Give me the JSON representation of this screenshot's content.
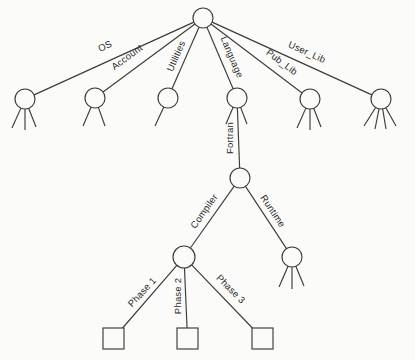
{
  "diagram": {
    "canvas": {
      "width": 415,
      "height": 360,
      "background": "#fbfbf9",
      "stroke_color": "#3c3c3c",
      "text_color": "#2a2a2a",
      "stroke_width": 1.15
    },
    "nodes": [
      {
        "id": "root",
        "shape": "circle",
        "x": 203,
        "y": 18,
        "r": 10
      },
      {
        "id": "os",
        "shape": "circle",
        "x": 25,
        "y": 99,
        "r": 10,
        "legs": [
          [
            -13,
            29
          ],
          [
            0,
            31
          ],
          [
            11,
            28
          ]
        ]
      },
      {
        "id": "account",
        "shape": "circle",
        "x": 95,
        "y": 98,
        "r": 10,
        "legs": [
          [
            -12,
            28
          ],
          [
            10,
            28
          ]
        ]
      },
      {
        "id": "utilities",
        "shape": "circle",
        "x": 168,
        "y": 98,
        "r": 10,
        "legs": [
          [
            -13,
            28
          ]
        ]
      },
      {
        "id": "language",
        "shape": "circle",
        "x": 237,
        "y": 98,
        "r": 10,
        "legs": [
          [
            -11,
            26
          ],
          [
            10,
            26
          ]
        ]
      },
      {
        "id": "pub-lib",
        "shape": "circle",
        "x": 310,
        "y": 99,
        "r": 10,
        "legs": [
          [
            -13,
            29
          ],
          [
            0,
            31
          ],
          [
            11,
            28
          ]
        ]
      },
      {
        "id": "user-lib",
        "shape": "circle",
        "x": 381,
        "y": 99,
        "r": 10,
        "legs": [
          [
            -17,
            27
          ],
          [
            -6,
            30
          ],
          [
            5,
            30
          ],
          [
            15,
            27
          ]
        ]
      },
      {
        "id": "fortran",
        "shape": "circle",
        "x": 240,
        "y": 178,
        "r": 10
      },
      {
        "id": "compiler",
        "shape": "circle",
        "x": 184,
        "y": 257,
        "r": 11
      },
      {
        "id": "runtime",
        "shape": "circle",
        "x": 292,
        "y": 257,
        "r": 10,
        "legs": [
          [
            -13,
            30
          ],
          [
            0,
            32
          ],
          [
            12,
            29
          ]
        ]
      },
      {
        "id": "phase-1",
        "shape": "square",
        "x": 113.5,
        "y": 338.5,
        "size": 21
      },
      {
        "id": "phase-2",
        "shape": "square",
        "x": 187.5,
        "y": 338.5,
        "size": 21
      },
      {
        "id": "phase-3",
        "shape": "square",
        "x": 262.5,
        "y": 338.5,
        "size": 21
      }
    ],
    "edges": [
      {
        "from": "root",
        "to": "os",
        "label": "OS",
        "label_x": 105,
        "label_y": 46,
        "label_rotation": -24.5
      },
      {
        "from": "root",
        "to": "account",
        "label": "Account",
        "label_x": 127,
        "label_y": 57,
        "label_rotation": -36.5
      },
      {
        "from": "root",
        "to": "utilities",
        "label": "Utilities",
        "label_x": 176,
        "label_y": 56,
        "label_rotation": -66
      },
      {
        "from": "root",
        "to": "language",
        "label": "Language",
        "label_x": 232,
        "label_y": 57,
        "label_rotation": 67
      },
      {
        "from": "root",
        "to": "pub-lib",
        "label": "Pub_Lib",
        "label_x": 282,
        "label_y": 62,
        "label_rotation": 37
      },
      {
        "from": "root",
        "to": "user-lib",
        "label": "User_Lib",
        "label_x": 307,
        "label_y": 52,
        "label_rotation": 24.5
      },
      {
        "from": "language",
        "to": "fortran",
        "label": "Fortran",
        "label_x": 230,
        "label_y": 138,
        "label_rotation": -90
      },
      {
        "from": "fortran",
        "to": "compiler",
        "label": "Compiler",
        "label_x": 204,
        "label_y": 211,
        "label_rotation": -55
      },
      {
        "from": "fortran",
        "to": "runtime",
        "label": "Runtime",
        "label_x": 273,
        "label_y": 211,
        "label_rotation": 56.5
      },
      {
        "from": "compiler",
        "to": "phase-1",
        "label": "Phase 1",
        "label_x": 142,
        "label_y": 292,
        "label_rotation": -47
      },
      {
        "from": "compiler",
        "to": "phase-2",
        "label": "Phase 2",
        "label_x": 178,
        "label_y": 296,
        "label_rotation": -90
      },
      {
        "from": "compiler",
        "to": "phase-3",
        "label": "Phase 3",
        "label_x": 231,
        "label_y": 289,
        "label_rotation": 45
      }
    ]
  }
}
